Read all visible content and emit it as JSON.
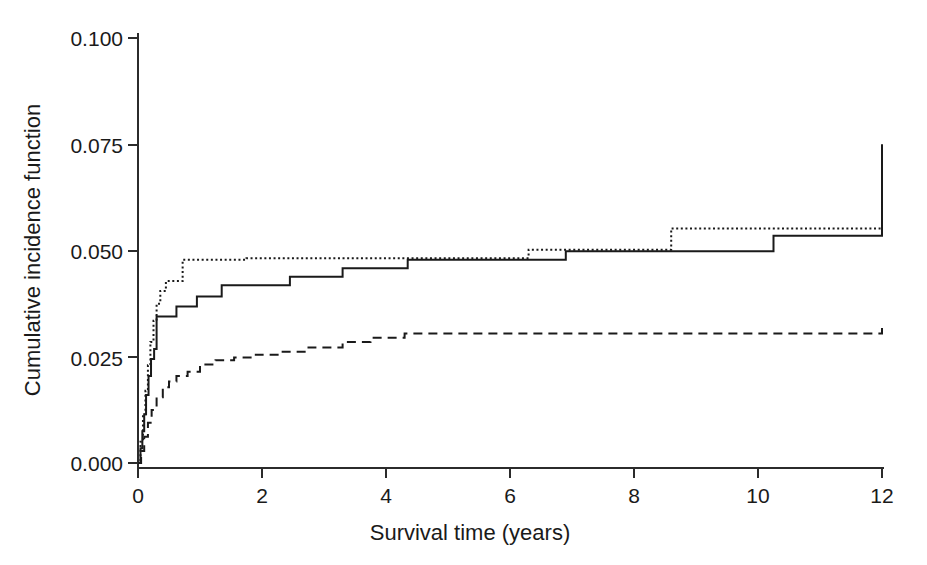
{
  "chart_data": {
    "type": "line",
    "title": "",
    "subtitle": "",
    "xlabel": "Survival time (years)",
    "ylabel": "Cumulative incidence function",
    "xlim": [
      0,
      12
    ],
    "ylim": [
      0.0,
      0.1
    ],
    "xticks": [
      0,
      2,
      4,
      6,
      8,
      10,
      12
    ],
    "xticklabels": [
      "0",
      "2",
      "4",
      "6",
      "8",
      "10",
      "12"
    ],
    "yticks": [
      0.0,
      0.025,
      0.05,
      0.075,
      0.1
    ],
    "yticklabels": [
      "0.000",
      "0.025",
      "0.050",
      "0.075",
      "0.100"
    ],
    "grid": false,
    "legend": "none",
    "step_type": "post",
    "series": [
      {
        "name": "solid-curve",
        "style": "solid",
        "color": "#1a1a1a",
        "x": [
          0.0,
          0.04,
          0.07,
          0.1,
          0.13,
          0.17,
          0.21,
          0.26,
          0.3,
          0.62,
          0.95,
          1.35,
          2.45,
          3.3,
          4.35,
          6.9,
          10.25,
          12.0
        ],
        "y": [
          0.0,
          0.0035,
          0.0075,
          0.0115,
          0.016,
          0.0205,
          0.0245,
          0.0268,
          0.0345,
          0.0368,
          0.0392,
          0.0418,
          0.0438,
          0.0458,
          0.0478,
          0.0498,
          0.0535,
          0.075
        ],
        "final_value": 0.075
      },
      {
        "name": "dotted-curve",
        "style": "dotted",
        "color": "#1a1a1a",
        "x": [
          0.0,
          0.04,
          0.08,
          0.12,
          0.16,
          0.2,
          0.25,
          0.3,
          0.36,
          0.45,
          0.72,
          1.75,
          6.3,
          8.6,
          12.0
        ],
        "y": [
          0.0,
          0.005,
          0.011,
          0.017,
          0.023,
          0.0285,
          0.0335,
          0.0375,
          0.0405,
          0.0428,
          0.0478,
          0.0482,
          0.0502,
          0.0552,
          0.0652
        ],
        "final_value": 0.0652
      },
      {
        "name": "dashed-curve",
        "style": "dashed",
        "color": "#1a1a1a",
        "x": [
          0.0,
          0.05,
          0.1,
          0.16,
          0.22,
          0.3,
          0.4,
          0.5,
          0.62,
          0.8,
          1.0,
          1.25,
          1.55,
          1.9,
          2.3,
          2.75,
          3.3,
          3.75,
          4.3,
          12.0
        ],
        "y": [
          0.0,
          0.0028,
          0.0062,
          0.0095,
          0.0125,
          0.0155,
          0.0178,
          0.0192,
          0.0205,
          0.0215,
          0.0232,
          0.0242,
          0.0248,
          0.0255,
          0.0262,
          0.0272,
          0.0285,
          0.0295,
          0.0305,
          0.0325
        ],
        "final_value": 0.0325
      }
    ]
  },
  "axes": {
    "x_title": "Survival time (years)",
    "y_title": "Cumulative incidence function",
    "x_tick_labels": [
      "0",
      "2",
      "4",
      "6",
      "8",
      "10",
      "12"
    ],
    "y_tick_labels": [
      "0.000",
      "0.025",
      "0.050",
      "0.075",
      "0.100"
    ]
  },
  "colors": {
    "foreground": "#1a1a1a",
    "axis": "#2b2b2b",
    "background": "#ffffff"
  }
}
